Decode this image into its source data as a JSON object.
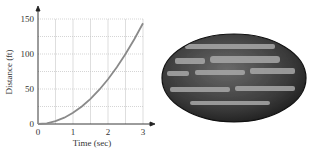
{
  "chart_data": {
    "type": "line",
    "title": "",
    "xlabel": "Time (sec)",
    "ylabel": "Distance (ft)",
    "xlim": [
      0,
      3
    ],
    "ylim": [
      0,
      150
    ],
    "xticks": [
      "0",
      "1",
      "2",
      "3"
    ],
    "yticks": [
      "0",
      "50",
      "100",
      "150"
    ],
    "grid": true,
    "legend": null,
    "series": [
      {
        "name": "distance",
        "x": [
          0,
          0.25,
          0.5,
          0.75,
          1,
          1.25,
          1.5,
          1.75,
          2,
          2.25,
          2.5,
          2.75,
          3
        ],
        "y": [
          0,
          1,
          4,
          9,
          16,
          25,
          36,
          49,
          64,
          81,
          100,
          121,
          144
        ],
        "color": "#8a8a8a"
      }
    ]
  },
  "image": {
    "subject": "watermelon"
  }
}
